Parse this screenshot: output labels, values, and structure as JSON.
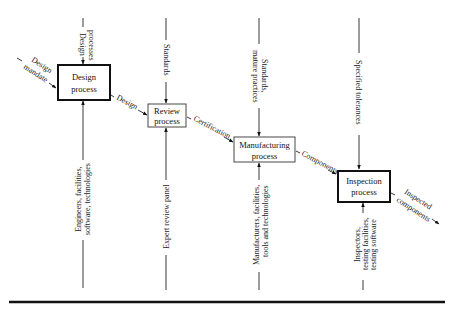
{
  "diagram": {
    "type": "IDEF0 process flow",
    "processes": [
      {
        "id": "design",
        "line1": "Design",
        "line2": "process",
        "border": "thick"
      },
      {
        "id": "review",
        "line1": "Review",
        "line2": "process",
        "border": "thin"
      },
      {
        "id": "manufacturing",
        "line1": "Manufacturing",
        "line2": "process",
        "border": "thin"
      },
      {
        "id": "inspection",
        "line1": "Inspection",
        "line2": "process",
        "border": "thick"
      }
    ],
    "inputs": {
      "design_mandate_1": "Design",
      "design_mandate_2": "mandate"
    },
    "flows": {
      "design_to_review": "Design",
      "review_to_manufacturing": "Certification",
      "manufacturing_to_inspection": "Components",
      "output_1": "Inspected",
      "output_2": "components"
    },
    "controls": {
      "design_1": "Design",
      "design_2": "processes",
      "review": "Standards",
      "manufacturing_1": "Standards,",
      "manufacturing_2": "mature practices",
      "inspection": "Specified tolerances"
    },
    "mechanisms": {
      "design_1": "Engineers, facilities,",
      "design_2": "software, technologies",
      "review": "Expert review panel",
      "manufacturing_1": "Manufacturers, facilities,",
      "manufacturing_2": "tools and technologies",
      "inspection_1": "Inspectors,",
      "inspection_2": "testing facilities,",
      "inspection_3": "testing software"
    },
    "colors": {
      "ink": "#111111",
      "background": "#ffffff"
    }
  }
}
